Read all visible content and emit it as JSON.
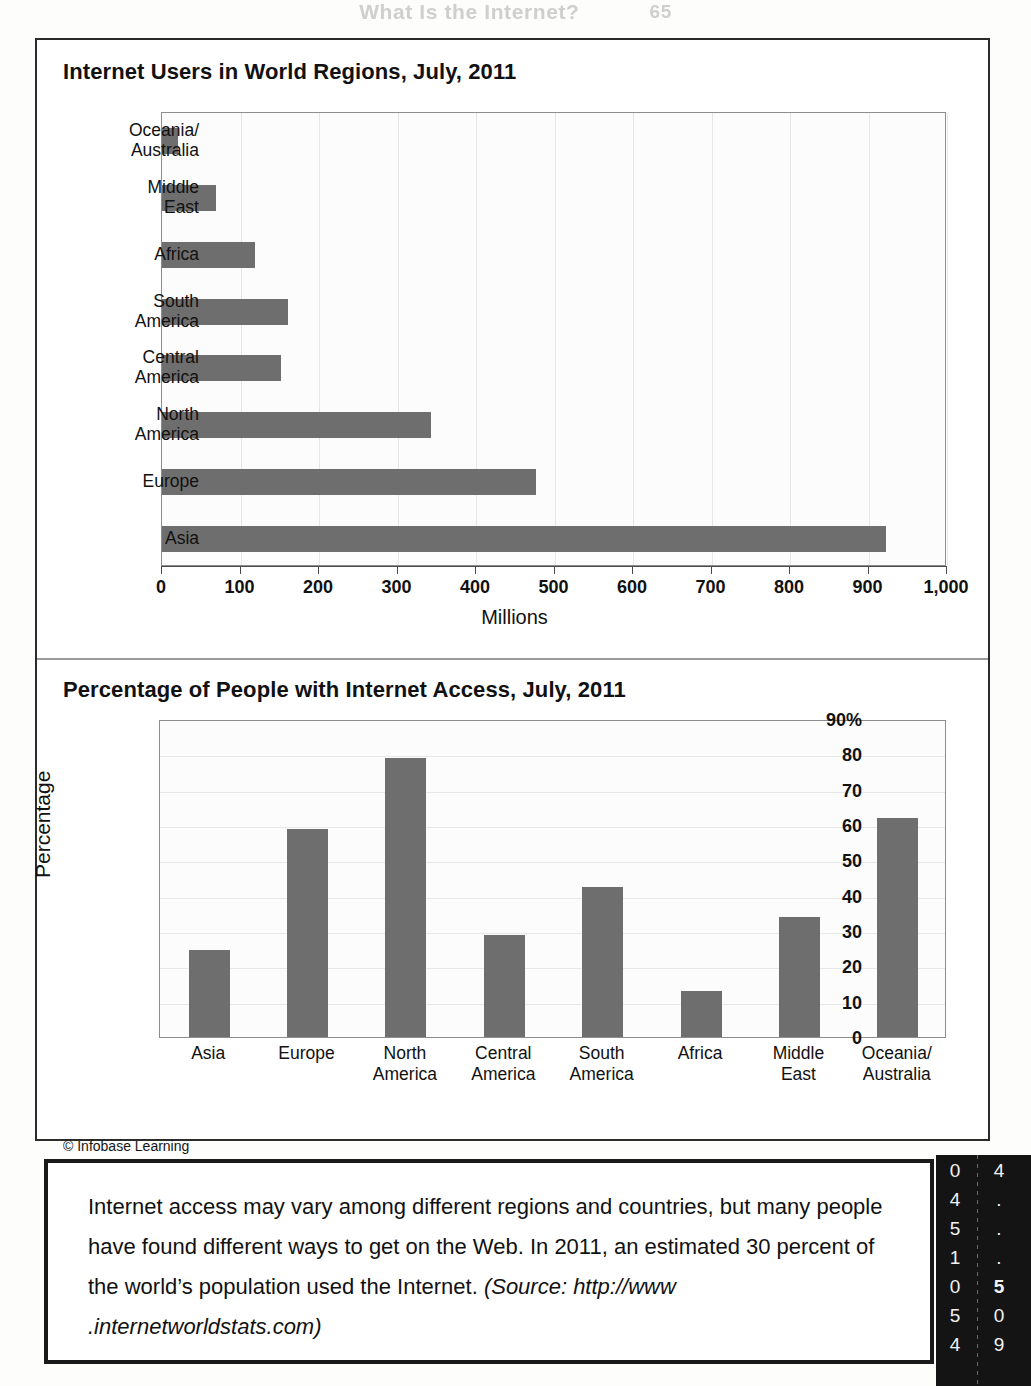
{
  "page": {
    "running_head": "What Is the Internet?",
    "page_number": "65",
    "credit": "© Infobase Learning"
  },
  "chart_data": [
    {
      "type": "bar",
      "orientation": "horizontal",
      "title": "Internet Users in World Regions, July, 2011",
      "xlabel": "Millions",
      "ylabel": "",
      "xlim": [
        0,
        1000
      ],
      "xticks": [
        "0",
        "100",
        "200",
        "300",
        "400",
        "500",
        "600",
        "700",
        "800",
        "900",
        "1,000"
      ],
      "xtick_values": [
        0,
        100,
        200,
        300,
        400,
        500,
        600,
        700,
        800,
        900,
        1000
      ],
      "grid": true,
      "legend": "none",
      "bar_color": "#6e6e6e",
      "categories": [
        "Oceania/ Australia",
        "Middle East",
        "Africa",
        "South America",
        "Central America",
        "North America",
        "Europe",
        "Asia"
      ],
      "category_lines": [
        [
          "Oceania/",
          "Australia"
        ],
        [
          "Middle",
          "East"
        ],
        [
          "Africa"
        ],
        [
          "South",
          "America"
        ],
        [
          "Central",
          "America"
        ],
        [
          "North",
          "America"
        ],
        [
          "Europe"
        ],
        [
          "Asia"
        ]
      ],
      "values": [
        21,
        69,
        119,
        161,
        152,
        343,
        476,
        922
      ]
    },
    {
      "type": "bar",
      "orientation": "vertical",
      "title": "Percentage of People with Internet Access, July, 2011",
      "xlabel": "",
      "ylabel": "Percentage",
      "ylim": [
        0,
        90
      ],
      "yticks": [
        "90%",
        "80",
        "70",
        "60",
        "50",
        "40",
        "30",
        "20",
        "10",
        "0"
      ],
      "ytick_values": [
        90,
        80,
        70,
        60,
        50,
        40,
        30,
        20,
        10,
        0
      ],
      "grid": true,
      "legend": "none",
      "bar_color": "#6e6e6e",
      "categories": [
        "Asia",
        "Europe",
        "North America",
        "Central America",
        "South America",
        "Africa",
        "Middle East",
        "Oceania/ Australia"
      ],
      "category_lines": [
        [
          "Asia"
        ],
        [
          "Europe"
        ],
        [
          "North",
          "America"
        ],
        [
          "Central",
          "America"
        ],
        [
          "South",
          "America"
        ],
        [
          "Africa"
        ],
        [
          "Middle",
          "East"
        ],
        [
          "Oceania/",
          "Australia"
        ]
      ],
      "values": [
        24.5,
        59,
        79,
        29,
        42.5,
        13,
        34,
        62
      ]
    }
  ],
  "caption": {
    "plain_1": "Internet access may vary among different regions and countries, but many people have found different ways to get on the Web. In 2011, an estimated 30 percent of the world’s population used the Internet. ",
    "italic": "(Source: http://www .internetworldstats.com)"
  },
  "edge_strip": {
    "column_1": [
      "0",
      "4",
      "5",
      "1",
      "0",
      "5",
      "4"
    ],
    "column_2": [
      "4",
      ".",
      ".",
      ".",
      "5",
      "0",
      "9"
    ]
  }
}
